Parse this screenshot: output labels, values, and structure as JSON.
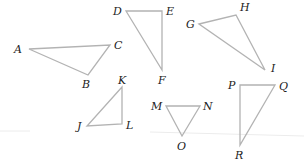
{
  "diagram": {
    "stroke_color": "#b3b3b3",
    "label_color": "#222222",
    "triangles": [
      {
        "name": "ABC",
        "vertices": [
          {
            "label": "A",
            "x": 29,
            "y": 49,
            "lx": 14,
            "ly": 53
          },
          {
            "label": "C",
            "x": 110,
            "y": 45,
            "lx": 114,
            "ly": 49
          },
          {
            "label": "B",
            "x": 88,
            "y": 75,
            "lx": 82,
            "ly": 88
          }
        ]
      },
      {
        "name": "DEF",
        "vertices": [
          {
            "label": "D",
            "x": 126,
            "y": 11,
            "lx": 113,
            "ly": 15
          },
          {
            "label": "E",
            "x": 162,
            "y": 11,
            "lx": 166,
            "ly": 15
          },
          {
            "label": "F",
            "x": 162,
            "y": 70,
            "lx": 158,
            "ly": 84
          }
        ]
      },
      {
        "name": "GHI",
        "vertices": [
          {
            "label": "G",
            "x": 199,
            "y": 24,
            "lx": 186,
            "ly": 28
          },
          {
            "label": "H",
            "x": 236,
            "y": 15,
            "lx": 240,
            "ly": 11
          },
          {
            "label": "I",
            "x": 265,
            "y": 70,
            "lx": 271,
            "ly": 72
          }
        ]
      },
      {
        "name": "JKL",
        "vertices": [
          {
            "label": "K",
            "x": 122,
            "y": 87,
            "lx": 118,
            "ly": 84
          },
          {
            "label": "J",
            "x": 87,
            "y": 126,
            "lx": 77,
            "ly": 130
          },
          {
            "label": "L",
            "x": 122,
            "y": 124,
            "lx": 126,
            "ly": 129
          }
        ]
      },
      {
        "name": "MNO",
        "vertices": [
          {
            "label": "M",
            "x": 166,
            "y": 106,
            "lx": 151,
            "ly": 110
          },
          {
            "label": "N",
            "x": 200,
            "y": 106,
            "lx": 203,
            "ly": 110
          },
          {
            "label": "O",
            "x": 182,
            "y": 136,
            "lx": 177,
            "ly": 150
          }
        ]
      },
      {
        "name": "PQR",
        "vertices": [
          {
            "label": "P",
            "x": 240,
            "y": 85,
            "lx": 228,
            "ly": 89
          },
          {
            "label": "Q",
            "x": 275,
            "y": 85,
            "lx": 279,
            "ly": 90
          },
          {
            "label": "R",
            "x": 240,
            "y": 145,
            "lx": 235,
            "ly": 159
          }
        ]
      }
    ]
  }
}
